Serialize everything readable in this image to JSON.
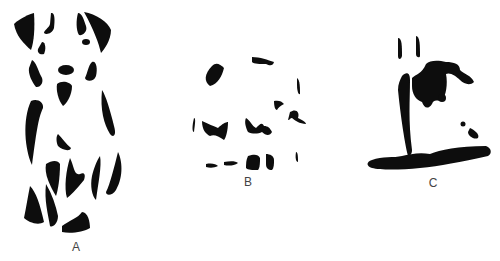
{
  "figures": [
    {
      "id": "A",
      "label": "A",
      "depicts": "fragmented dog figure"
    },
    {
      "id": "B",
      "label": "B",
      "depicts": "fragmented clock/face figure"
    },
    {
      "id": "C",
      "label": "C",
      "depicts": "fragmented figure with base"
    }
  ],
  "colors": {
    "ink": "#0d0d0d",
    "background": "#ffffff",
    "label": "#444444"
  }
}
